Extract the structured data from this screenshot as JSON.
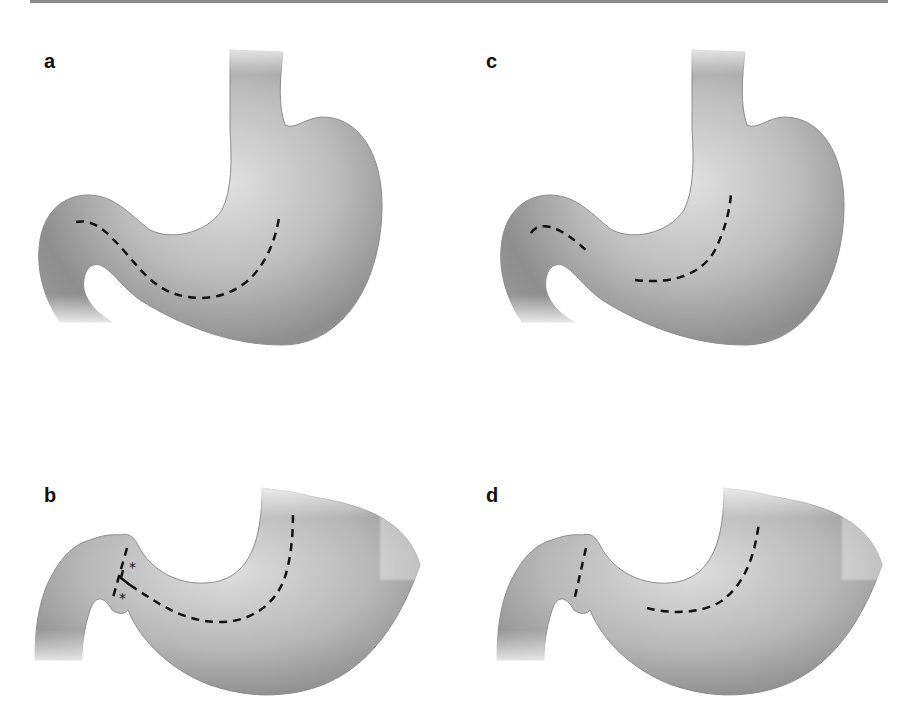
{
  "figure": {
    "panels": [
      {
        "id": "a",
        "label": "a",
        "description": "Stomach with continuous dashed resection line from duodenum along greater curvature to body"
      },
      {
        "id": "b",
        "label": "b",
        "description": "Reconstructed stomach with dashed lines at pylorus and along body, two asterisks marking anastomosis corners",
        "markers": [
          "*",
          "*"
        ]
      },
      {
        "id": "c",
        "label": "c",
        "description": "Stomach with two separate dashed line segments: one on duodenum and one along body"
      },
      {
        "id": "d",
        "label": "d",
        "description": "Reconstructed stomach with dashed line at pylorus and separate dashed curve in body"
      }
    ],
    "colors": {
      "organ_light": "#d9d9d9",
      "organ_mid": "#a8a8a8",
      "organ_dark": "#7a7a7a",
      "outline": "#8c8c8c",
      "dash": "#111111",
      "rule": "#8a8a8a"
    }
  }
}
